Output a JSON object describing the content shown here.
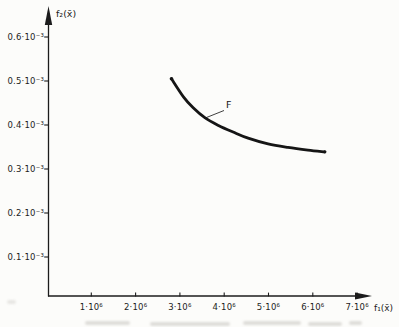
{
  "figure": {
    "background": "#fcfcfa",
    "ink": "#1c1c1c"
  },
  "chart_data": {
    "type": "line",
    "title": "",
    "legend": "none",
    "x_axis": {
      "label": "f₁(x̄)",
      "unit": "×10⁶",
      "range": [
        0,
        7.3
      ],
      "grid": false,
      "ticks": [
        {
          "value": 1,
          "label": "1·10⁶"
        },
        {
          "value": 2,
          "label": "2·10⁶"
        },
        {
          "value": 3,
          "label": "3·10⁶"
        },
        {
          "value": 4,
          "label": "4·10⁶"
        },
        {
          "value": 5,
          "label": "5·10⁶"
        },
        {
          "value": 6,
          "label": "6·10⁶"
        },
        {
          "value": 7,
          "label": "7·10⁶"
        }
      ]
    },
    "y_axis": {
      "label": "f₂(x̄)",
      "unit": "×10⁻³",
      "range": [
        0,
        0.65
      ],
      "grid": false,
      "ticks": [
        {
          "value": 0.1,
          "label": "0.1·10⁻³"
        },
        {
          "value": 0.2,
          "label": "0.2·10⁻³"
        },
        {
          "value": 0.3,
          "label": "0.3·10⁻³"
        },
        {
          "value": 0.4,
          "label": "0.4·10⁻³"
        },
        {
          "value": 0.5,
          "label": "0.5·10⁻³"
        },
        {
          "value": 0.6,
          "label": "0.6·10⁻³"
        }
      ]
    },
    "series": [
      {
        "name": "F",
        "x_unit": "1e6",
        "y_unit": "1e-3",
        "points": [
          [
            2.81,
            0.505
          ],
          [
            3.08,
            0.464
          ],
          [
            3.3,
            0.439
          ],
          [
            3.57,
            0.416
          ],
          [
            3.87,
            0.399
          ],
          [
            4.2,
            0.384
          ],
          [
            4.54,
            0.37
          ],
          [
            4.99,
            0.357
          ],
          [
            5.44,
            0.349
          ],
          [
            5.89,
            0.343
          ],
          [
            6.27,
            0.339
          ]
        ]
      }
    ],
    "annotation": {
      "text": "F"
    }
  }
}
